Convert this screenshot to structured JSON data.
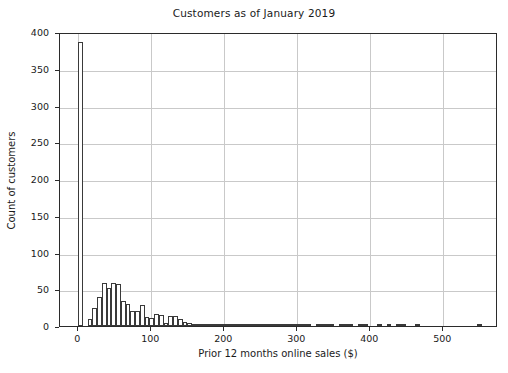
{
  "chart_data": {
    "type": "bar",
    "title": "Customers as of January 2019",
    "xlabel": "Prior 12 months online sales ($)",
    "ylabel": "Count of customers",
    "grid": true,
    "legend": null,
    "xlim": [
      -25,
      575
    ],
    "ylim": [
      0,
      400
    ],
    "xticks": [
      0,
      100,
      200,
      300,
      400,
      500
    ],
    "xtick_labels": [
      "0",
      "100",
      "200",
      "300",
      "400",
      "500"
    ],
    "yticks": [
      0,
      50,
      100,
      150,
      200,
      250,
      300,
      350,
      400
    ],
    "ytick_labels": [
      "0",
      "50",
      "100",
      "150",
      "200",
      "250",
      "300",
      "350",
      "400"
    ],
    "bin_width": 6.5,
    "bin_starts": [
      0,
      6.5,
      13,
      19.5,
      26,
      32.5,
      39,
      45.5,
      52,
      58.5,
      65,
      71.5,
      78,
      84.5,
      91,
      97.5,
      104,
      110.5,
      117,
      123.5,
      130,
      136.5,
      143,
      149.5,
      156,
      162.5,
      169,
      175.5,
      182,
      188.5,
      195,
      201.5,
      208,
      214.5,
      221,
      227.5,
      234,
      240.5,
      247,
      253.5,
      260,
      266.5,
      273,
      279.5,
      286,
      292.5,
      299,
      305.5,
      312,
      318.5,
      325,
      331.5,
      338,
      344.5,
      351,
      357.5,
      364,
      370.5,
      377,
      383.5,
      390,
      396.5,
      403,
      409.5,
      416,
      422.5,
      429,
      435.5,
      442,
      448.5,
      455,
      461.5,
      468,
      474.5,
      481,
      487.5,
      494,
      500.5,
      507,
      513.5,
      520,
      526.5,
      533,
      539.5,
      546
    ],
    "values": [
      387,
      0,
      9,
      25,
      40,
      59,
      52,
      59,
      57,
      34,
      30,
      21,
      21,
      29,
      12,
      11,
      16,
      15,
      4,
      13,
      13,
      9,
      5,
      4,
      1,
      1,
      2,
      2,
      1,
      2,
      2,
      1,
      2,
      3,
      2,
      1,
      1,
      2,
      1,
      1,
      2,
      1,
      1,
      1,
      2,
      1,
      1,
      2,
      1,
      0,
      1,
      2,
      1,
      1,
      0,
      1,
      3,
      2,
      0,
      1,
      1,
      0,
      0,
      1,
      0,
      1,
      0,
      2,
      2,
      0,
      0,
      1,
      0,
      0,
      0,
      0,
      0,
      0,
      0,
      0,
      0,
      0,
      0,
      0,
      1
    ],
    "bar_facecolor": "#ffffff",
    "bar_edgecolor": "#3a3a3a",
    "gridcolor": "#c9c9c9",
    "axiscolor": "#2b2b2b",
    "background": "#ffffff"
  }
}
